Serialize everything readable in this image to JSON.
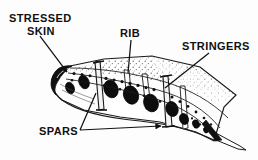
{
  "figure": {
    "background_color": "#fdfdfd",
    "ink_color": "#111111",
    "labels": {
      "stressed_skin_line1": "STRESSED",
      "stressed_skin_line2": "SKIN",
      "rib": "RIB",
      "stringers": "STRINGERS",
      "spars": "SPARS"
    },
    "parts": [
      {
        "name": "stressed-skin",
        "label": "STRESSED SKIN",
        "description": "Outer load-bearing wing surface panel"
      },
      {
        "name": "rib",
        "label": "RIB",
        "description": "Transverse former with elliptical lightening holes"
      },
      {
        "name": "stringers",
        "label": "STRINGERS",
        "description": "Spanwise stiffeners along the skin"
      },
      {
        "name": "spars",
        "label": "SPARS",
        "description": "Main spanwise structural beams, front and rear"
      }
    ],
    "lightening_holes": [
      {
        "cx": 70,
        "cy": 88,
        "rx": 4.2,
        "ry": 6.0,
        "rot": -22
      },
      {
        "cx": 84,
        "cy": 82,
        "rx": 5.0,
        "ry": 7.0,
        "rot": -22
      },
      {
        "cx": 111,
        "cy": 89,
        "rx": 7.0,
        "ry": 9.0,
        "rot": -20
      },
      {
        "cx": 131,
        "cy": 95,
        "rx": 7.4,
        "ry": 9.4,
        "rot": -20
      },
      {
        "cx": 151,
        "cy": 103,
        "rx": 7.2,
        "ry": 9.0,
        "rot": -20
      },
      {
        "cx": 172,
        "cy": 109,
        "rx": 6.0,
        "ry": 7.6,
        "rot": -20
      },
      {
        "cx": 184,
        "cy": 119,
        "rx": 4.4,
        "ry": 5.6,
        "rot": -20
      },
      {
        "cx": 196,
        "cy": 124,
        "rx": 3.3,
        "ry": 4.2,
        "rot": -20
      },
      {
        "cx": 206,
        "cy": 130,
        "rx": 2.4,
        "ry": 3.0,
        "rot": -20
      },
      {
        "cx": 214,
        "cy": 134,
        "rx": 1.7,
        "ry": 2.2,
        "rot": -20
      }
    ],
    "leaders": [
      {
        "name": "stressed-skin-leader",
        "from": [
          40,
          36
        ],
        "to": [
          68,
          73
        ],
        "arrow": true
      },
      {
        "name": "rib-leader",
        "from": [
          131,
          40
        ],
        "to": [
          128,
          73
        ],
        "arrow": false
      },
      {
        "name": "stringers-leader",
        "from": [
          209,
          53
        ],
        "to": [
          164,
          88
        ],
        "arrow": false
      },
      {
        "name": "spars-leader-front",
        "from": [
          80,
          130
        ],
        "to": [
          96,
          93
        ],
        "arrow": false
      },
      {
        "name": "spars-leader-rear",
        "from": [
          80,
          130
        ],
        "to": [
          163,
          126
        ],
        "arrow": true
      }
    ]
  }
}
